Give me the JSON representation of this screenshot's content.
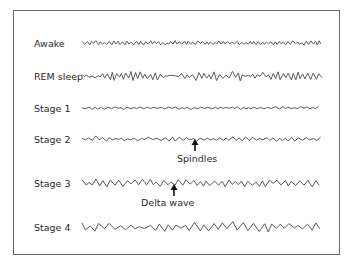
{
  "figure": {
    "rows": [
      {
        "label": "Awake",
        "pattern": "low-amplitude high-frequency"
      },
      {
        "label": "REM sleep",
        "pattern": "sawtooth moderate-amplitude high-frequency"
      },
      {
        "label": "Stage 1",
        "pattern": "low-amplitude mixed-frequency"
      },
      {
        "label": "Stage 2",
        "pattern": "sleep spindles and K-complexes"
      },
      {
        "label": "Stage 3",
        "pattern": "some delta waves"
      },
      {
        "label": "Stage 4",
        "pattern": "high-amplitude slow delta waves"
      }
    ],
    "annotations": [
      {
        "text": "Spindles",
        "row": "Stage 2"
      },
      {
        "text": "Delta wave",
        "row": "Stage 3"
      }
    ],
    "colors": {
      "trace": "#5a5a5a",
      "frame": "#6a6a6a",
      "text": "#2a2a2a"
    }
  }
}
